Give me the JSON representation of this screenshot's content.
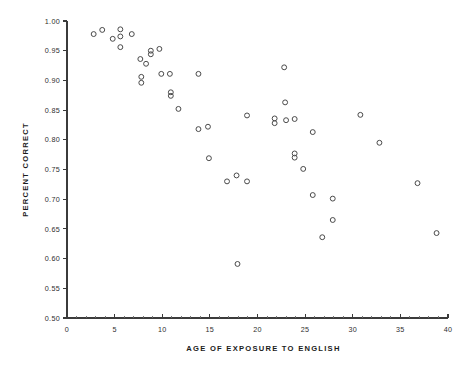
{
  "chart_data": {
    "type": "scatter",
    "title": "",
    "xlabel": "AGE OF EXPOSURE TO ENGLISH",
    "ylabel": "PERCENT CORRECT",
    "xlim": [
      0,
      40
    ],
    "ylim": [
      0.5,
      1.0
    ],
    "xticks": [
      0,
      5,
      10,
      15,
      20,
      25,
      30,
      35,
      40
    ],
    "xtick_labels": [
      "0",
      "5",
      "10",
      "15",
      "20",
      "25",
      "30",
      "35",
      "40"
    ],
    "x_minor_tick_step": 1,
    "yticks": [
      0.5,
      0.55,
      0.6,
      0.65,
      0.7,
      0.75,
      0.8,
      0.85,
      0.9,
      0.95,
      1.0
    ],
    "ytick_labels": [
      "0.50",
      "0.55",
      "0.60",
      "0.65",
      "0.70",
      "0.75",
      "0.80",
      "0.85",
      "0.90",
      "0.95",
      "1.00"
    ],
    "grid": false,
    "legend": null,
    "marker": "open-circle",
    "marker_color": "#4a4a4a",
    "points": [
      {
        "x": 2.8,
        "y": 0.978
      },
      {
        "x": 3.7,
        "y": 0.985
      },
      {
        "x": 4.8,
        "y": 0.97
      },
      {
        "x": 5.6,
        "y": 0.986
      },
      {
        "x": 5.6,
        "y": 0.974
      },
      {
        "x": 5.6,
        "y": 0.956
      },
      {
        "x": 6.8,
        "y": 0.978
      },
      {
        "x": 7.7,
        "y": 0.936
      },
      {
        "x": 7.8,
        "y": 0.906
      },
      {
        "x": 7.8,
        "y": 0.896
      },
      {
        "x": 8.3,
        "y": 0.928
      },
      {
        "x": 8.8,
        "y": 0.95
      },
      {
        "x": 8.8,
        "y": 0.944
      },
      {
        "x": 9.7,
        "y": 0.953
      },
      {
        "x": 9.9,
        "y": 0.911
      },
      {
        "x": 10.8,
        "y": 0.911
      },
      {
        "x": 10.9,
        "y": 0.88
      },
      {
        "x": 10.9,
        "y": 0.874
      },
      {
        "x": 11.7,
        "y": 0.852
      },
      {
        "x": 13.8,
        "y": 0.911
      },
      {
        "x": 13.8,
        "y": 0.818
      },
      {
        "x": 14.8,
        "y": 0.822
      },
      {
        "x": 14.9,
        "y": 0.769
      },
      {
        "x": 16.8,
        "y": 0.73
      },
      {
        "x": 17.8,
        "y": 0.74
      },
      {
        "x": 17.9,
        "y": 0.591
      },
      {
        "x": 18.9,
        "y": 0.841
      },
      {
        "x": 18.9,
        "y": 0.73
      },
      {
        "x": 21.8,
        "y": 0.836
      },
      {
        "x": 21.8,
        "y": 0.828
      },
      {
        "x": 22.8,
        "y": 0.922
      },
      {
        "x": 22.9,
        "y": 0.863
      },
      {
        "x": 23.0,
        "y": 0.833
      },
      {
        "x": 23.9,
        "y": 0.835
      },
      {
        "x": 23.9,
        "y": 0.777
      },
      {
        "x": 23.9,
        "y": 0.77
      },
      {
        "x": 24.8,
        "y": 0.751
      },
      {
        "x": 25.8,
        "y": 0.813
      },
      {
        "x": 25.8,
        "y": 0.707
      },
      {
        "x": 26.8,
        "y": 0.636
      },
      {
        "x": 27.9,
        "y": 0.701
      },
      {
        "x": 27.9,
        "y": 0.665
      },
      {
        "x": 30.8,
        "y": 0.842
      },
      {
        "x": 32.8,
        "y": 0.795
      },
      {
        "x": 36.8,
        "y": 0.727
      },
      {
        "x": 38.8,
        "y": 0.643
      }
    ]
  }
}
